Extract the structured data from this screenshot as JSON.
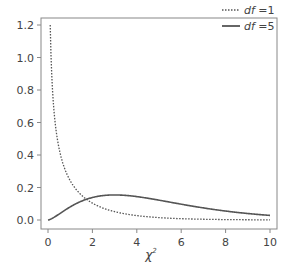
{
  "chart_data": {
    "type": "line",
    "title": "",
    "xlabel": "χ²",
    "ylabel": "",
    "xlim": [
      0,
      10
    ],
    "ylim": [
      0,
      1.2
    ],
    "x_ticks": [
      "0",
      "2",
      "4",
      "6",
      "8",
      "10"
    ],
    "y_ticks": [
      "0.0",
      "0.2",
      "0.4",
      "0.6",
      "0.8",
      "1.0",
      "1.2"
    ],
    "grid": false,
    "legend_position": "top-right",
    "series": [
      {
        "name": "df =1",
        "style": "dotted",
        "x": [
          0.1,
          0.2,
          0.3,
          0.5,
          0.75,
          1,
          1.5,
          2,
          3,
          4,
          5,
          6,
          7,
          8,
          9,
          10
        ],
        "values": [
          1.2,
          0.807,
          0.627,
          0.439,
          0.318,
          0.242,
          0.154,
          0.104,
          0.051,
          0.027,
          0.015,
          0.008,
          0.005,
          0.003,
          0.002,
          0.001
        ]
      },
      {
        "name": "df =5",
        "style": "solid",
        "x": [
          0,
          0.5,
          1,
          1.5,
          2,
          2.5,
          3,
          3.5,
          4,
          5,
          6,
          7,
          8,
          9,
          10
        ],
        "values": [
          0.0,
          0.037,
          0.081,
          0.115,
          0.138,
          0.15,
          0.154,
          0.151,
          0.144,
          0.122,
          0.097,
          0.074,
          0.055,
          0.04,
          0.028
        ]
      }
    ]
  },
  "legend": {
    "items": [
      {
        "prefix": "df",
        "suffix": " =1"
      },
      {
        "prefix": "df",
        "suffix": " =5"
      }
    ]
  },
  "axis": {
    "xlabel_base": "χ",
    "xlabel_sup": "2"
  }
}
